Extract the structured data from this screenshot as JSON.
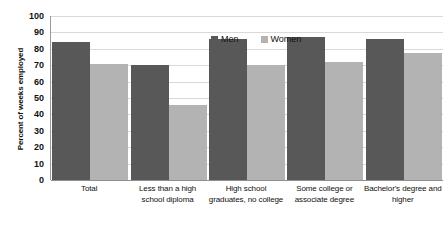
{
  "chart_data": {
    "type": "bar",
    "title": "",
    "subtitle": "",
    "xlabel": "",
    "ylabel": "Percent of weeks employed",
    "ylim": [
      0,
      100
    ],
    "y_ticks": [
      0,
      10,
      20,
      30,
      40,
      50,
      60,
      70,
      80,
      90,
      100
    ],
    "grid": true,
    "legend_position": "top-center",
    "categories": [
      "Total",
      "Less than a high school diploma",
      "High school graduates, no college",
      "Some college or associate degree",
      "Bachelor's degree and higher"
    ],
    "series": [
      {
        "name": "Men",
        "color": "#585858",
        "values": [
          84,
          70,
          86,
          87,
          86
        ]
      },
      {
        "name": "Women",
        "color": "#b3b3b3",
        "values": [
          71,
          46,
          70,
          72,
          77.5
        ]
      }
    ]
  },
  "axis": {
    "y_title": "Percent of weeks employed",
    "tick_labels": [
      "100",
      "90",
      "80",
      "70",
      "60",
      "50",
      "40",
      "30",
      "20",
      "10",
      "0"
    ]
  },
  "legend": {
    "items": [
      {
        "label": "Men"
      },
      {
        "label": "Women"
      }
    ]
  },
  "x_axis": {
    "labels": [
      "Total",
      "Less than a high school diploma",
      "High school graduates, no college",
      "Some college or associate degree",
      "Bachelor's degree and higher"
    ]
  }
}
